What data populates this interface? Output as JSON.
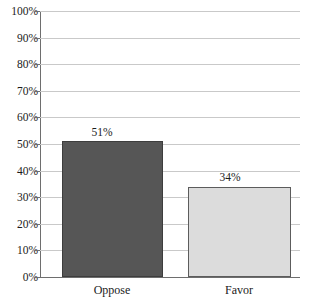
{
  "chart_data": {
    "type": "bar",
    "title": "",
    "subtitle": "",
    "xlabel": "",
    "ylabel": "",
    "categories": [
      "Oppose",
      "Favor"
    ],
    "values": [
      51,
      34
    ],
    "value_labels": [
      "51%",
      "34%"
    ],
    "series": [
      {
        "name": "Response",
        "values": [
          51,
          34
        ]
      }
    ],
    "ylim": [
      0,
      100
    ],
    "y_ticks": [
      0,
      10,
      20,
      30,
      40,
      50,
      60,
      70,
      80,
      90,
      100
    ],
    "y_tick_labels": [
      "0%",
      "10%",
      "20%",
      "30%",
      "40%",
      "50%",
      "60%",
      "70%",
      "80%",
      "90%",
      "100%"
    ],
    "grid": true,
    "grid_axis": "y",
    "legend": false,
    "legend_position": "none",
    "bar_colors": [
      "#565656",
      "#dcdcdc"
    ],
    "bar_border_colors": [
      "#3d3d3d",
      "#5c5c5c"
    ],
    "grid_color": "#c9c9c9",
    "axis_color": "#6e6e6e"
  },
  "axis": {
    "y_labels": {
      "t100": "100%",
      "t90": "90%",
      "t80": "80%",
      "t70": "70%",
      "t60": "60%",
      "t50": "50%",
      "t40": "40%",
      "t30": "30%",
      "t20": "20%",
      "t10": "10%",
      "t0": "0%"
    }
  },
  "bars": {
    "oppose": {
      "category": "Oppose",
      "value_label": "51%"
    },
    "favor": {
      "category": "Favor",
      "value_label": "34%"
    }
  }
}
